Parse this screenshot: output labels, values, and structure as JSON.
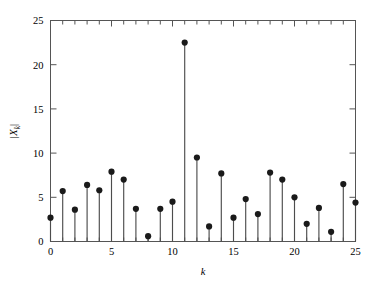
{
  "chart_data": {
    "type": "scatter",
    "plot_style": "stem",
    "title": "",
    "subtitle": "",
    "xlabel": "k",
    "ylabel": "|X_k|",
    "ylabel_base": "|X",
    "ylabel_sub": "k",
    "ylabel_close": "|",
    "xlim": [
      0,
      25
    ],
    "ylim": [
      0,
      25
    ],
    "grid": false,
    "legend": null,
    "xticks": [
      0,
      5,
      10,
      15,
      20,
      25
    ],
    "xtick_labels": [
      "0",
      "5",
      "10",
      "15",
      "20",
      "25"
    ],
    "xminor_ticks": [
      1,
      2,
      3,
      4,
      6,
      7,
      8,
      9,
      11,
      12,
      13,
      14,
      16,
      17,
      18,
      19,
      21,
      22,
      23,
      24
    ],
    "yticks": [
      0,
      5,
      10,
      15,
      20,
      25
    ],
    "ytick_labels": [
      "0",
      "5",
      "10",
      "15",
      "20",
      "25"
    ],
    "x": [
      0,
      1,
      2,
      3,
      4,
      5,
      6,
      7,
      8,
      9,
      10,
      11,
      12,
      13,
      14,
      15,
      16,
      17,
      18,
      19,
      20,
      21,
      22,
      23,
      24,
      25
    ],
    "values": [
      2.7,
      5.7,
      3.6,
      6.4,
      5.8,
      7.9,
      7.0,
      3.7,
      0.6,
      3.7,
      4.5,
      22.5,
      9.5,
      1.7,
      7.7,
      2.7,
      4.8,
      3.1,
      7.8,
      7.0,
      5.0,
      2.0,
      3.8,
      1.1,
      6.5,
      4.4
    ],
    "colors": {
      "marker": "#1a1a1a",
      "stem": "#4d4d4d",
      "axis": "#555555",
      "background": "#ffffff"
    },
    "marker_shape": "circle",
    "marker_size": 3.1
  }
}
